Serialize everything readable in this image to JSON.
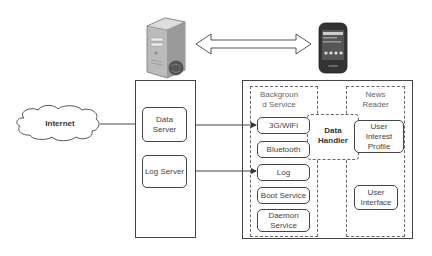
{
  "diagram": {
    "internet": {
      "label": "Internet",
      "icon": "cloud-icon"
    },
    "server_icon": "server-icon",
    "phone_icon": "smartphone-icon",
    "link_icon": "double-arrow-icon",
    "server": {
      "data_server": "Data Server",
      "data_server_lines": [
        "Data",
        "Server"
      ],
      "log_server": "Log Server"
    },
    "device": {
      "background_service": {
        "title_lines": [
          "Backgroun",
          "d Service"
        ],
        "items": [
          {
            "label": "3G/WiFi"
          },
          {
            "label": "Bluetooth"
          },
          {
            "label": "Log"
          },
          {
            "label": "Boot Service"
          },
          {
            "label_lines": [
              "Daemon",
              "Service"
            ]
          }
        ]
      },
      "data_handler": {
        "label_lines": [
          "Data",
          "Handler"
        ]
      },
      "news_reader": {
        "title_lines": [
          "News",
          "Reader"
        ],
        "items": [
          {
            "label_lines": [
              "User",
              "Interest",
              "Profile"
            ]
          },
          {
            "label_lines": [
              "User",
              "Interface"
            ]
          }
        ]
      }
    },
    "connections": [
      {
        "from": "Internet",
        "to": "Data Server",
        "type": "arrow"
      },
      {
        "from": "3G/WiFi",
        "to": "Data Server",
        "type": "bidirectional"
      },
      {
        "from": "Log",
        "to": "Log Server",
        "type": "bidirectional"
      },
      {
        "from": "Server",
        "to": "Phone",
        "type": "double-block-arrow"
      }
    ]
  }
}
